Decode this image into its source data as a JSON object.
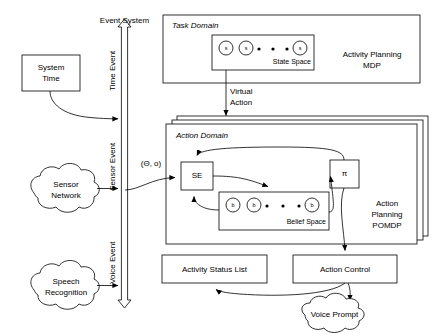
{
  "diagram": {
    "event_system": {
      "label": "Event System",
      "channel_labels": [
        "Time Event",
        "Sensor Event",
        "Voice Event"
      ]
    },
    "sources": [
      {
        "name": "system-time",
        "label_line1": "System",
        "label_line2": "Time",
        "shape": "rect"
      },
      {
        "name": "sensor-network",
        "label_line1": "Sensor",
        "label_line2": "Network",
        "shape": "cloud"
      },
      {
        "name": "speech-recognition",
        "label_line1": "Speech",
        "label_line2": "Recognition",
        "shape": "cloud"
      }
    ],
    "task_domain": {
      "title": "Task Domain",
      "planner_line1": "Activity Planning",
      "planner_line2": "MDP",
      "state_space": {
        "label": "State Space",
        "node_label": "s",
        "node_count": 3,
        "ellipsis_dots": 3
      }
    },
    "virtual_action": {
      "line1": "Virtual",
      "line2": "Action"
    },
    "action_domain": {
      "title": "Action Domain",
      "stack_layers": 2,
      "planner_line1": "Action",
      "planner_line2": "Planning",
      "planner_line3": "POMDP",
      "state_estimator": "SE",
      "policy": "π",
      "observation_label": "(Θ, o)",
      "belief_space": {
        "label": "Belief Space",
        "node_label": "b",
        "node_count": 3,
        "ellipsis_dots": 3
      }
    },
    "outputs": [
      {
        "name": "activity-status-list",
        "label": "Activity Status List",
        "shape": "rect"
      },
      {
        "name": "action-control",
        "label": "Action Control",
        "shape": "rect"
      },
      {
        "name": "voice-prompt",
        "label": "Voice Prompt",
        "shape": "cloud"
      }
    ],
    "colors": {
      "stroke": "#000000",
      "fill": "#ffffff",
      "background": "#ffffff"
    }
  }
}
